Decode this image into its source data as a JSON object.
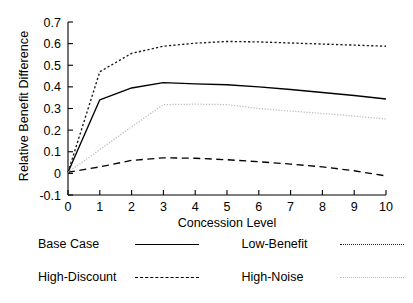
{
  "chart_data": {
    "type": "line",
    "title": "",
    "xlabel": "Concession Level",
    "ylabel": "Relative Benefit Difference",
    "x": [
      0,
      1,
      2,
      3,
      4,
      5,
      6,
      7,
      8,
      9,
      10
    ],
    "xlim": [
      0,
      10
    ],
    "ylim": [
      -0.1,
      0.7
    ],
    "xticks": [
      "0",
      "1",
      "2",
      "3",
      "4",
      "5",
      "6",
      "7",
      "8",
      "9",
      "10"
    ],
    "yticks": [
      "0.7",
      "0.6",
      "0.5",
      "0.4",
      "0.3",
      "0.2",
      "0.1",
      "0",
      "-0.1"
    ],
    "ytick_values": [
      0.7,
      0.6,
      0.5,
      0.4,
      0.3,
      0.2,
      0.1,
      0,
      -0.1
    ],
    "grid": false,
    "legend_position": "below",
    "series": [
      {
        "name": "Base Case",
        "style": "solid",
        "color": "#000000",
        "values": [
          0.005,
          0.34,
          0.395,
          0.42,
          0.414,
          0.41,
          0.4,
          0.388,
          0.374,
          0.36,
          0.344
        ]
      },
      {
        "name": "Low-Benefit",
        "style": "dotted",
        "color": "#1a1a1a",
        "values": [
          0.005,
          0.47,
          0.555,
          0.588,
          0.602,
          0.61,
          0.608,
          0.603,
          0.598,
          0.593,
          0.588
        ]
      },
      {
        "name": "High-Discount",
        "style": "dashed",
        "color": "#000000",
        "values": [
          0.005,
          0.03,
          0.06,
          0.072,
          0.07,
          0.063,
          0.054,
          0.043,
          0.03,
          0.012,
          -0.012
        ]
      },
      {
        "name": "High-Noise",
        "style": "fine-dotted",
        "color": "#b9b9b9",
        "values": [
          0.005,
          0.11,
          0.215,
          0.318,
          0.32,
          0.318,
          0.3,
          0.288,
          0.277,
          0.265,
          0.252
        ]
      }
    ]
  },
  "legend": {
    "entries": [
      {
        "label": "Base Case",
        "key": "k-solid"
      },
      {
        "label": "Low-Benefit",
        "key": "k-dot"
      },
      {
        "label": "High-Discount",
        "key": "k-dash"
      },
      {
        "label": "High-Noise",
        "key": "k-fine"
      }
    ]
  }
}
